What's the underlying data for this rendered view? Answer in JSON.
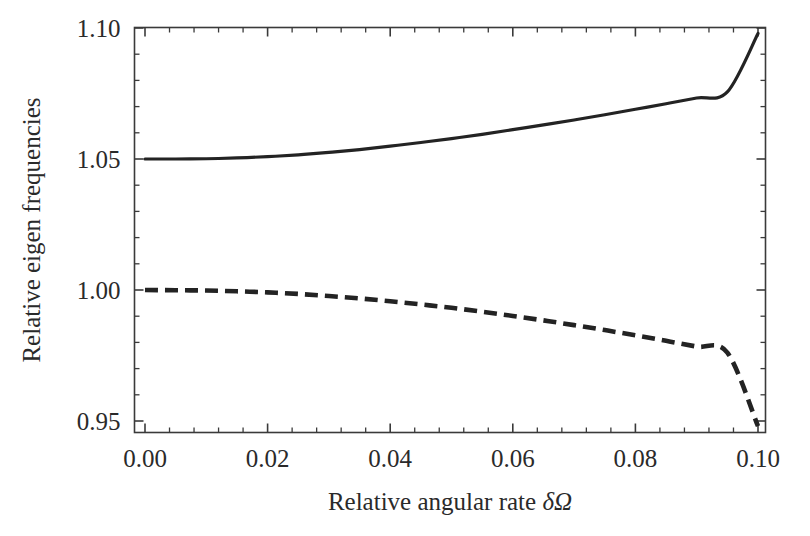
{
  "chart_data": {
    "type": "line",
    "title": "",
    "xlabel": "Relative angular rate δΩ",
    "ylabel": "Relative eigen frequencies",
    "xlim": [
      0.0,
      0.1
    ],
    "ylim": [
      0.95,
      0.11
    ],
    "grid": false,
    "legend": "none",
    "background": "#ffffff",
    "line_color": "#232323",
    "axis_color": "#3a3a3a",
    "x_ticks": [
      0.0,
      0.02,
      0.04,
      0.06,
      0.08,
      0.1
    ],
    "x_tick_labels": [
      "0.00",
      "0.02",
      "0.04",
      "0.06",
      "0.08",
      "0.10"
    ],
    "x_minor_step": 0.004,
    "y_ticks": [
      0.95,
      1.0,
      1.05,
      1.1
    ],
    "y_tick_labels": [
      "0.95",
      "1.00",
      "1.05",
      "1.10"
    ],
    "y_minor_step": 0.01,
    "x": [
      0.0,
      0.005,
      0.01,
      0.015,
      0.02,
      0.025,
      0.03,
      0.035,
      0.04,
      0.045,
      0.05,
      0.055,
      0.06,
      0.065,
      0.07,
      0.075,
      0.08,
      0.085,
      0.09,
      0.095,
      0.1
    ],
    "series": [
      {
        "name": "upper-branch",
        "style": "solid",
        "values": [
          1.05,
          1.05,
          1.0501,
          1.0504,
          1.0509,
          1.0516,
          1.0525,
          1.0536,
          1.0549,
          1.0563,
          1.0578,
          1.0594,
          1.0612,
          1.063,
          1.0649,
          1.0669,
          1.069,
          1.0711,
          1.0733,
          1.0756,
          1.0979
        ]
      },
      {
        "name": "lower-branch",
        "style": "dashed",
        "values": [
          1.0,
          0.9999,
          0.9998,
          0.9995,
          0.9991,
          0.9985,
          0.9977,
          0.9968,
          0.9957,
          0.9945,
          0.9932,
          0.9917,
          0.9901,
          0.9884,
          0.9866,
          0.9847,
          0.9827,
          0.9806,
          0.9784,
          0.9761,
          0.948
        ]
      }
    ]
  },
  "axes": {
    "x_title_prefix": "Relative angular rate ",
    "x_title_symbol": "δΩ",
    "y_title": "Relative eigen frequencies"
  }
}
